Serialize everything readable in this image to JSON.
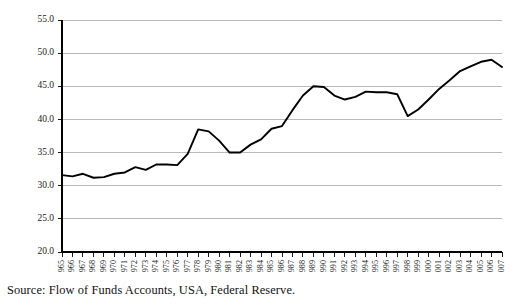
{
  "source_note": "Source: Flow of Funds Accounts, USA, Federal Reserve.",
  "chart_data": {
    "type": "line",
    "title": "",
    "subtitle": "",
    "xlabel": "",
    "ylabel": "",
    "grid": true,
    "legend": "none",
    "ylim": [
      20.0,
      55.0
    ],
    "yticks": [
      "20.0",
      "25.0",
      "30.0",
      "35.0",
      "40.0",
      "45.0",
      "50.0",
      "55.0"
    ],
    "ytick_values": [
      20.0,
      25.0,
      30.0,
      35.0,
      40.0,
      45.0,
      50.0,
      55.0
    ],
    "xlim": [
      1965,
      2007
    ],
    "categories": [
      "1965",
      "1966",
      "1967",
      "1968",
      "1969",
      "1970",
      "1971",
      "1972",
      "1973",
      "1974",
      "1975",
      "1976",
      "1977",
      "1978",
      "1979",
      "1980",
      "1981",
      "1982",
      "1983",
      "1984",
      "1985",
      "1986",
      "1987",
      "1988",
      "1989",
      "1990",
      "1991",
      "1992",
      "1993",
      "1994",
      "1995",
      "1996",
      "1997",
      "1998",
      "1999",
      "2000",
      "2001",
      "2002",
      "2003",
      "2004",
      "2005",
      "2006",
      "2007"
    ],
    "values": [
      31.6,
      31.4,
      31.8,
      31.2,
      31.3,
      31.8,
      32.0,
      32.8,
      32.4,
      33.2,
      33.2,
      33.1,
      34.8,
      38.5,
      38.2,
      36.8,
      35.0,
      35.0,
      36.2,
      37.0,
      38.6,
      39.0,
      41.4,
      43.6,
      45.0,
      44.9,
      43.6,
      43.0,
      43.4,
      44.2,
      44.1,
      44.1,
      43.8,
      40.5,
      41.5,
      43.0,
      44.6,
      45.9,
      47.3,
      48.0,
      48.7,
      49.0,
      47.9
    ],
    "series_name": "",
    "line_color": "#000000",
    "grid_color": "#a8a8a8"
  }
}
